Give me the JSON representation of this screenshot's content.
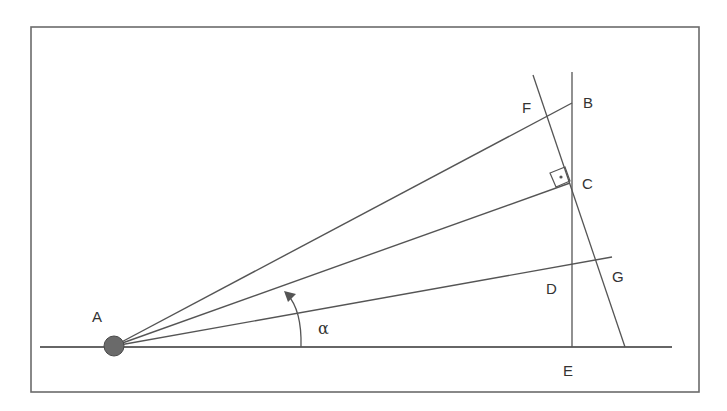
{
  "colors": {
    "background": "#ffffff",
    "frame": "#6b6b6b",
    "line": "#555555",
    "ground": "#666666",
    "point_fill": "#6a6a6a",
    "point_stroke": "#4a4a4a",
    "text": "#333333"
  },
  "frame": {
    "x": 31,
    "y": 27,
    "width": 668,
    "height": 365
  },
  "ground_line": {
    "x1": 40,
    "y1": 347,
    "x2": 672,
    "y2": 347
  },
  "points": {
    "A": {
      "x": 114,
      "y": 346
    },
    "B": {
      "x": 572,
      "y": 103
    },
    "C": {
      "x": 570,
      "y": 183
    },
    "D": {
      "x": 572,
      "y": 265
    },
    "E": {
      "x": 572,
      "y": 347
    },
    "F": {
      "x": 549,
      "y": 116
    },
    "G": {
      "x": 596,
      "y": 260
    }
  },
  "lines": {
    "vertical_BE": {
      "x1": 572,
      "y1": 72,
      "x2": 572,
      "y2": 347
    },
    "tilted_FG": {
      "x1": 533,
      "y1": 75,
      "x2": 625,
      "y2": 347
    },
    "ray_AB": {
      "x1": 114,
      "y1": 346,
      "x2": 572,
      "y2": 103
    },
    "ray_AC": {
      "x1": 114,
      "y1": 346,
      "x2": 570,
      "y2": 183
    },
    "ray_AG": {
      "x1": 114,
      "y1": 346,
      "x2": 612,
      "y2": 257
    }
  },
  "right_angle_marker": {
    "corners": [
      [
        570,
        181
      ],
      [
        565,
        167
      ],
      [
        550,
        173
      ],
      [
        556,
        187
      ]
    ],
    "dot": {
      "x": 561,
      "y": 177,
      "r": 1.6
    }
  },
  "angle_arc": {
    "path": "M 301 347 Q 302 310 287 294",
    "arrow_tip": {
      "x": 284,
      "y": 291
    }
  },
  "labels": [
    {
      "id": "A",
      "text": "A",
      "x": 92,
      "y": 322
    },
    {
      "id": "B",
      "text": "B",
      "x": 583,
      "y": 108
    },
    {
      "id": "C",
      "text": "C",
      "x": 582,
      "y": 189
    },
    {
      "id": "D",
      "text": "D",
      "x": 546,
      "y": 294
    },
    {
      "id": "E",
      "text": "E",
      "x": 563,
      "y": 376
    },
    {
      "id": "F",
      "text": "F",
      "x": 522,
      "y": 113
    },
    {
      "id": "G",
      "text": "G",
      "x": 612,
      "y": 282
    }
  ],
  "angle_label": {
    "text": "α",
    "x": 318,
    "y": 334
  }
}
